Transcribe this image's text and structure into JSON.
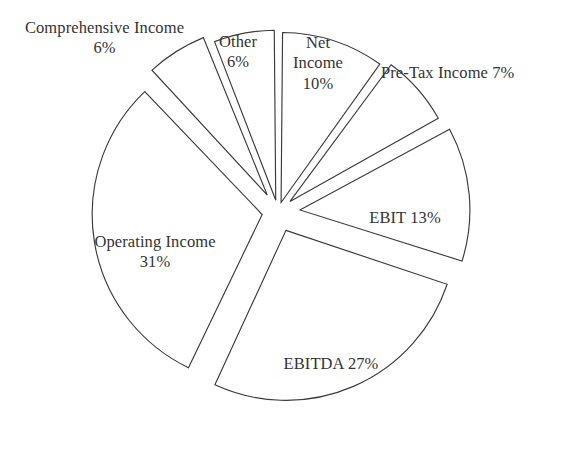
{
  "chart_data": {
    "type": "pie",
    "title": "",
    "subtitle": "",
    "xlabel": "",
    "ylabel": "",
    "legend_position": "none",
    "grid": false,
    "units": "percent",
    "start_angle_deg": 0,
    "direction": "clockwise",
    "exploded": true,
    "categories": [
      "Net Income",
      "Pre-Tax Income",
      "EBIT",
      "EBITDA",
      "Operating Income",
      "Comprehensive Income",
      "Other"
    ],
    "values": [
      10,
      7,
      13,
      27,
      31,
      6,
      6
    ],
    "slices": [
      {
        "name": "Net Income",
        "value": 10,
        "label_lines": [
          "Net",
          "Income",
          "10%"
        ],
        "label_text": "Net\nIncome\n10%",
        "percent_text": "10%",
        "fill": "#ffffff",
        "stroke": "#3b3b3b"
      },
      {
        "name": "Pre-Tax Income",
        "value": 7,
        "label_lines": [
          "Pre-Tax Income 7%"
        ],
        "label_text": "Pre-Tax Income 7%",
        "percent_text": "7%",
        "fill": "#ffffff",
        "stroke": "#3b3b3b"
      },
      {
        "name": "EBIT",
        "value": 13,
        "label_lines": [
          "EBIT 13%"
        ],
        "label_text": "EBIT 13%",
        "percent_text": "13%",
        "fill": "#ffffff",
        "stroke": "#3b3b3b"
      },
      {
        "name": "EBITDA",
        "value": 27,
        "label_lines": [
          "EBITDA 27%"
        ],
        "label_text": "EBITDA 27%",
        "percent_text": "27%",
        "fill": "#ffffff",
        "stroke": "#3b3b3b"
      },
      {
        "name": "Operating Income",
        "value": 31,
        "label_lines": [
          "Operating Income",
          "31%"
        ],
        "label_text": "Operating Income\n31%",
        "percent_text": "31%",
        "fill": "#ffffff",
        "stroke": "#3b3b3b"
      },
      {
        "name": "Comprehensive Income",
        "value": 6,
        "label_lines": [
          "Comprehensive Income",
          "6%"
        ],
        "label_text": "Comprehensive Income\n6%",
        "percent_text": "6%",
        "fill": "#ffffff",
        "stroke": "#3b3b3b"
      },
      {
        "name": "Other",
        "value": 6,
        "label_lines": [
          "Other",
          "6%"
        ],
        "label_text": "Other\n6%",
        "percent_text": "6%",
        "fill": "#ffffff",
        "stroke": "#3b3b3b"
      }
    ]
  },
  "colors": {
    "background": "#ffffff",
    "slice_fill": "#ffffff",
    "slice_stroke": "#3b3b3b",
    "label_text": "#333333"
  },
  "geometry": {
    "center_x": 278,
    "center_y": 212,
    "radius": 170,
    "explode_offsets": [
      10,
      16,
      22,
      20,
      16,
      20,
      12
    ]
  }
}
